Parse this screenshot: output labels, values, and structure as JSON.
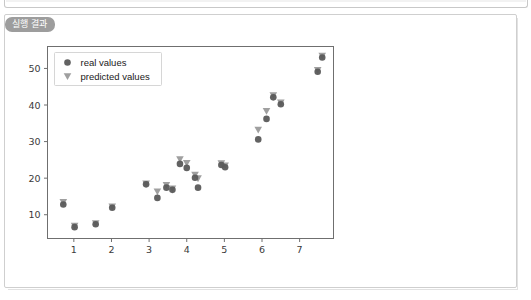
{
  "window": {
    "top_strip_name": "panel-edge"
  },
  "card": {
    "tab_label": "실행 결과"
  },
  "chart_data": {
    "type": "scatter",
    "title": "",
    "xlabel": "",
    "ylabel": "",
    "xlim": [
      0.3,
      7.9
    ],
    "ylim": [
      3.5,
      56
    ],
    "grid": false,
    "legend_position": "upper left",
    "xticks": [
      1,
      2,
      3,
      4,
      5,
      6,
      7
    ],
    "yticks": [
      10,
      20,
      30,
      40,
      50
    ],
    "legend": [
      {
        "name": "real values",
        "marker": "circle",
        "color": "#5a5a5a"
      },
      {
        "name": "predicted values",
        "marker": "triangle-down",
        "color": "#9a9a9a"
      }
    ],
    "series": [
      {
        "name": "real values",
        "marker": "circle",
        "color": "#5a5a5a",
        "points": [
          {
            "x": 0.72,
            "y": 12.8
          },
          {
            "x": 1.02,
            "y": 6.6
          },
          {
            "x": 1.58,
            "y": 7.4
          },
          {
            "x": 2.02,
            "y": 11.9
          },
          {
            "x": 2.92,
            "y": 18.3
          },
          {
            "x": 3.22,
            "y": 14.6
          },
          {
            "x": 3.46,
            "y": 17.4
          },
          {
            "x": 3.62,
            "y": 16.8
          },
          {
            "x": 3.82,
            "y": 23.9
          },
          {
            "x": 4.0,
            "y": 22.8
          },
          {
            "x": 4.22,
            "y": 20.1
          },
          {
            "x": 4.3,
            "y": 17.4
          },
          {
            "x": 4.92,
            "y": 23.6
          },
          {
            "x": 5.02,
            "y": 23.0
          },
          {
            "x": 5.9,
            "y": 30.6
          },
          {
            "x": 6.12,
            "y": 36.2
          },
          {
            "x": 6.3,
            "y": 42.1
          },
          {
            "x": 6.5,
            "y": 40.2
          },
          {
            "x": 7.48,
            "y": 49.1
          },
          {
            "x": 7.6,
            "y": 53.0
          }
        ]
      },
      {
        "name": "predicted values",
        "marker": "triangle-down",
        "color": "#9a9a9a",
        "points": [
          {
            "x": 0.72,
            "y": 13.4
          },
          {
            "x": 1.02,
            "y": 6.9
          },
          {
            "x": 1.58,
            "y": 7.6
          },
          {
            "x": 2.02,
            "y": 12.2
          },
          {
            "x": 2.92,
            "y": 18.5
          },
          {
            "x": 3.22,
            "y": 16.3
          },
          {
            "x": 3.46,
            "y": 18.1
          },
          {
            "x": 3.62,
            "y": 17.1
          },
          {
            "x": 3.82,
            "y": 25.1
          },
          {
            "x": 4.0,
            "y": 24.1
          },
          {
            "x": 4.22,
            "y": 20.9
          },
          {
            "x": 4.3,
            "y": 19.9
          },
          {
            "x": 4.92,
            "y": 24.0
          },
          {
            "x": 5.02,
            "y": 23.4
          },
          {
            "x": 5.9,
            "y": 33.2
          },
          {
            "x": 6.12,
            "y": 38.3
          },
          {
            "x": 6.3,
            "y": 42.6
          },
          {
            "x": 6.5,
            "y": 40.6
          },
          {
            "x": 7.48,
            "y": 49.5
          },
          {
            "x": 7.6,
            "y": 53.4
          }
        ]
      }
    ]
  }
}
